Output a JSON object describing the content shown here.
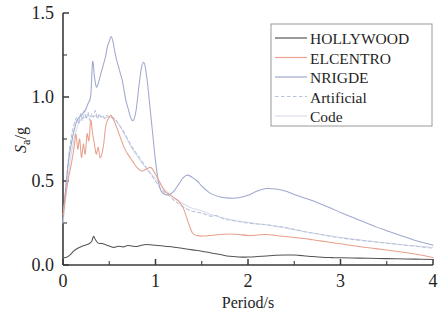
{
  "chart_data": {
    "type": "line",
    "title": "",
    "xlabel": "Period/s",
    "ylabel": "Sa/g",
    "ylabel_parts": {
      "main": "S",
      "sub": "a",
      "suffix": "/g"
    },
    "xlim": [
      0,
      4
    ],
    "ylim": [
      0.0,
      1.5
    ],
    "x_ticks": [
      "0",
      "1",
      "2",
      "3",
      "4"
    ],
    "x_tick_values": [
      0,
      1,
      2,
      3,
      4
    ],
    "x_minor_step": 0.5,
    "y_ticks": [
      "0.0",
      "0.5",
      "1.0",
      "1.5"
    ],
    "y_tick_values": [
      0.0,
      0.5,
      1.0,
      1.5
    ],
    "y_minor_step": 0.25,
    "grid": false,
    "legend_position": "top-right",
    "series": [
      {
        "name": "HOLLYWOOD",
        "color": "#545454",
        "dash": "none",
        "x": [
          0.0,
          0.04,
          0.08,
          0.12,
          0.16,
          0.2,
          0.24,
          0.28,
          0.31,
          0.33,
          0.35,
          0.38,
          0.42,
          0.46,
          0.5,
          0.55,
          0.6,
          0.65,
          0.7,
          0.75,
          0.8,
          0.85,
          0.9,
          0.95,
          1.0,
          1.1,
          1.2,
          1.3,
          1.4,
          1.5,
          1.6,
          1.7,
          1.8,
          1.9,
          2.0,
          2.1,
          2.2,
          2.3,
          2.4,
          2.5,
          2.6,
          2.7,
          2.8,
          2.9,
          3.0,
          3.2,
          3.4,
          3.6,
          3.8,
          4.0
        ],
        "y": [
          0.043,
          0.046,
          0.062,
          0.085,
          0.1,
          0.11,
          0.118,
          0.126,
          0.14,
          0.17,
          0.152,
          0.13,
          0.128,
          0.121,
          0.113,
          0.105,
          0.112,
          0.108,
          0.116,
          0.112,
          0.11,
          0.118,
          0.122,
          0.12,
          0.118,
          0.112,
          0.106,
          0.098,
          0.09,
          0.082,
          0.072,
          0.062,
          0.052,
          0.048,
          0.047,
          0.05,
          0.054,
          0.058,
          0.06,
          0.059,
          0.055,
          0.05,
          0.046,
          0.044,
          0.043,
          0.041,
          0.039,
          0.037,
          0.035,
          0.033
        ]
      },
      {
        "name": "ELCENTRO",
        "color": "#e8a08c",
        "dash": "none",
        "x": [
          0.0,
          0.03,
          0.06,
          0.09,
          0.12,
          0.14,
          0.16,
          0.18,
          0.2,
          0.22,
          0.24,
          0.26,
          0.28,
          0.3,
          0.32,
          0.34,
          0.36,
          0.38,
          0.4,
          0.42,
          0.44,
          0.46,
          0.48,
          0.5,
          0.52,
          0.55,
          0.58,
          0.62,
          0.66,
          0.7,
          0.75,
          0.8,
          0.85,
          0.9,
          0.95,
          1.0,
          1.05,
          1.1,
          1.15,
          1.2,
          1.25,
          1.3,
          1.35,
          1.4,
          1.45,
          1.5,
          1.6,
          1.7,
          1.8,
          1.9,
          2.0,
          2.1,
          2.2,
          2.3,
          2.4,
          2.5,
          2.6,
          2.7,
          2.8,
          2.9,
          3.0,
          3.1,
          3.2,
          3.3,
          3.4,
          3.5,
          3.6,
          3.7,
          3.8,
          3.9,
          4.0
        ],
        "y": [
          0.3,
          0.42,
          0.52,
          0.6,
          0.7,
          0.78,
          0.69,
          0.75,
          0.64,
          0.72,
          0.66,
          0.78,
          0.74,
          0.86,
          0.78,
          0.72,
          0.66,
          0.7,
          0.64,
          0.66,
          0.72,
          0.82,
          0.86,
          0.88,
          0.89,
          0.86,
          0.82,
          0.76,
          0.7,
          0.66,
          0.62,
          0.58,
          0.56,
          0.57,
          0.58,
          0.54,
          0.49,
          0.44,
          0.42,
          0.4,
          0.38,
          0.34,
          0.26,
          0.19,
          0.175,
          0.172,
          0.176,
          0.182,
          0.184,
          0.182,
          0.176,
          0.178,
          0.182,
          0.176,
          0.17,
          0.164,
          0.158,
          0.15,
          0.142,
          0.134,
          0.126,
          0.118,
          0.11,
          0.103,
          0.096,
          0.089,
          0.082,
          0.074,
          0.066,
          0.056,
          0.044
        ]
      },
      {
        "name": "NRIGDE",
        "color": "#9fa8cf",
        "dash": "none",
        "x": [
          0.0,
          0.03,
          0.06,
          0.09,
          0.12,
          0.15,
          0.18,
          0.21,
          0.24,
          0.27,
          0.3,
          0.32,
          0.34,
          0.36,
          0.38,
          0.4,
          0.42,
          0.44,
          0.46,
          0.48,
          0.5,
          0.52,
          0.54,
          0.56,
          0.58,
          0.6,
          0.62,
          0.64,
          0.66,
          0.68,
          0.7,
          0.73,
          0.76,
          0.79,
          0.82,
          0.85,
          0.88,
          0.91,
          0.94,
          0.97,
          1.0,
          1.03,
          1.06,
          1.1,
          1.15,
          1.2,
          1.25,
          1.3,
          1.35,
          1.4,
          1.45,
          1.5,
          1.55,
          1.6,
          1.7,
          1.8,
          1.9,
          2.0,
          2.1,
          2.2,
          2.3,
          2.4,
          2.5,
          2.6,
          2.7,
          2.8,
          2.9,
          3.0,
          3.1,
          3.2,
          3.3,
          3.4,
          3.5,
          3.6,
          3.7,
          3.8,
          3.9,
          4.0
        ],
        "y": [
          0.28,
          0.46,
          0.62,
          0.72,
          0.8,
          0.86,
          0.88,
          0.9,
          0.92,
          0.96,
          1.01,
          1.21,
          1.12,
          1.06,
          1.08,
          1.12,
          1.16,
          1.2,
          1.24,
          1.3,
          1.33,
          1.36,
          1.33,
          1.27,
          1.22,
          1.18,
          1.14,
          1.1,
          1.04,
          0.98,
          0.94,
          0.88,
          0.86,
          0.92,
          1.06,
          1.18,
          1.2,
          1.1,
          0.94,
          0.78,
          0.62,
          0.5,
          0.44,
          0.42,
          0.42,
          0.44,
          0.48,
          0.52,
          0.535,
          0.52,
          0.5,
          0.47,
          0.445,
          0.425,
          0.405,
          0.398,
          0.4,
          0.415,
          0.44,
          0.455,
          0.452,
          0.44,
          0.42,
          0.4,
          0.382,
          0.36,
          0.338,
          0.312,
          0.29,
          0.268,
          0.246,
          0.224,
          0.204,
          0.184,
          0.166,
          0.148,
          0.132,
          0.118
        ]
      },
      {
        "name": "Artificial",
        "color": "#b8c2dd",
        "dash": "dashed",
        "x": [
          0.0,
          0.03,
          0.06,
          0.09,
          0.12,
          0.15,
          0.17,
          0.19,
          0.21,
          0.23,
          0.25,
          0.27,
          0.29,
          0.31,
          0.33,
          0.35,
          0.37,
          0.39,
          0.41,
          0.43,
          0.45,
          0.47,
          0.5,
          0.53,
          0.56,
          0.6,
          0.65,
          0.7,
          0.75,
          0.8,
          0.85,
          0.9,
          0.95,
          1.0,
          1.05,
          1.1,
          1.15,
          1.2,
          1.25,
          1.3,
          1.35,
          1.4,
          1.45,
          1.5,
          1.55,
          1.6,
          1.65,
          1.7,
          1.75,
          1.8,
          1.9,
          2.0,
          2.1,
          2.2,
          2.3,
          2.4,
          2.5,
          2.6,
          2.7,
          2.8,
          2.9,
          3.0,
          3.1,
          3.2,
          3.3,
          3.4,
          3.5,
          3.6,
          3.7,
          3.8,
          3.9,
          4.0
        ],
        "y": [
          0.26,
          0.46,
          0.64,
          0.76,
          0.84,
          0.88,
          0.84,
          0.9,
          0.86,
          0.92,
          0.87,
          0.91,
          0.86,
          0.9,
          0.88,
          0.92,
          0.87,
          0.9,
          0.88,
          0.89,
          0.87,
          0.89,
          0.88,
          0.88,
          0.87,
          0.84,
          0.8,
          0.75,
          0.7,
          0.66,
          0.62,
          0.58,
          0.54,
          0.5,
          0.46,
          0.43,
          0.41,
          0.385,
          0.365,
          0.345,
          0.33,
          0.32,
          0.315,
          0.308,
          0.3,
          0.29,
          0.295,
          0.285,
          0.272,
          0.268,
          0.258,
          0.25,
          0.244,
          0.24,
          0.232,
          0.224,
          0.212,
          0.2,
          0.19,
          0.18,
          0.17,
          0.162,
          0.154,
          0.148,
          0.142,
          0.136,
          0.13,
          0.124,
          0.118,
          0.112,
          0.106,
          0.1
        ]
      },
      {
        "name": "Code",
        "color": "#d8dde8",
        "dash": "none",
        "x": [
          0.0,
          0.04,
          0.08,
          0.12,
          0.16,
          0.2,
          0.24,
          0.28,
          0.32,
          0.36,
          0.4,
          0.45,
          0.5,
          0.55,
          0.6,
          0.65,
          0.7,
          0.75,
          0.8,
          0.85,
          0.9,
          0.95,
          1.0,
          1.05,
          1.1,
          1.15,
          1.2,
          1.25,
          1.3,
          1.35,
          1.4,
          1.45,
          1.5,
          1.55,
          1.6,
          1.65,
          1.7,
          1.8,
          1.9,
          2.0,
          2.1,
          2.2,
          2.3,
          2.4,
          2.5,
          2.6,
          2.7,
          2.8,
          2.9,
          3.0,
          3.1,
          3.2,
          3.3,
          3.4,
          3.5,
          3.6,
          3.7,
          3.8,
          3.9,
          4.0
        ],
        "y": [
          0.25,
          0.45,
          0.63,
          0.75,
          0.83,
          0.87,
          0.88,
          0.885,
          0.885,
          0.885,
          0.885,
          0.88,
          0.88,
          0.87,
          0.84,
          0.79,
          0.74,
          0.69,
          0.65,
          0.61,
          0.575,
          0.545,
          0.515,
          0.478,
          0.448,
          0.425,
          0.4,
          0.382,
          0.365,
          0.35,
          0.338,
          0.33,
          0.322,
          0.312,
          0.3,
          0.292,
          0.284,
          0.272,
          0.262,
          0.254,
          0.246,
          0.238,
          0.23,
          0.22,
          0.21,
          0.2,
          0.19,
          0.182,
          0.172,
          0.164,
          0.156,
          0.15,
          0.143,
          0.137,
          0.131,
          0.125,
          0.119,
          0.114,
          0.11,
          0.105
        ]
      }
    ]
  },
  "legend": {
    "entries": [
      {
        "label": "HOLLYWOOD"
      },
      {
        "label": "ELCENTRO"
      },
      {
        "label": "NRIGDE"
      },
      {
        "label": "Artificial"
      },
      {
        "label": "Code"
      }
    ]
  },
  "axes": {
    "x_title": "Period/s",
    "y_title_main": "S",
    "y_title_sub": "a",
    "y_title_suffix": "/g"
  }
}
